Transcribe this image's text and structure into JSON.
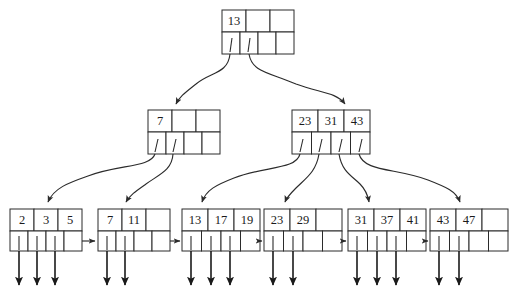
{
  "diagram": {
    "ink_color": "#2b2b2b",
    "fill_color": "#ffffff",
    "levels": 3,
    "fanout": 4
  },
  "root": {
    "name": "root-node",
    "keys": [
      "13",
      "",
      ""
    ],
    "pointers": [
      "p0",
      "p1",
      "p2",
      "p3"
    ],
    "occupied_pointers": 2
  },
  "internal": [
    {
      "name": "internal-node-left",
      "keys": [
        "7",
        "",
        ""
      ],
      "pointers": [
        "p0",
        "p1",
        "p2",
        "p3"
      ],
      "occupied_pointers": 2
    },
    {
      "name": "internal-node-right",
      "keys": [
        "23",
        "31",
        "43"
      ],
      "pointers": [
        "p0",
        "p1",
        "p2",
        "p3"
      ],
      "occupied_pointers": 4
    }
  ],
  "leaves": [
    {
      "name": "leaf-node-1",
      "keys": [
        "2",
        "3",
        "5"
      ],
      "record_pointers": 3
    },
    {
      "name": "leaf-node-2",
      "keys": [
        "7",
        "11",
        ""
      ],
      "record_pointers": 2
    },
    {
      "name": "leaf-node-3",
      "keys": [
        "13",
        "17",
        "19"
      ],
      "record_pointers": 3
    },
    {
      "name": "leaf-node-4",
      "keys": [
        "23",
        "29",
        ""
      ],
      "record_pointers": 2
    },
    {
      "name": "leaf-node-5",
      "keys": [
        "31",
        "37",
        "41"
      ],
      "record_pointers": 3
    },
    {
      "name": "leaf-node-6",
      "keys": [
        "43",
        "47",
        ""
      ],
      "record_pointers": 2
    }
  ],
  "sibling_links": 5,
  "geometry": {
    "root": {
      "x": 222,
      "y": 10,
      "cell_w": 24,
      "key_h": 22,
      "ptr_h": 22
    },
    "internal": [
      {
        "x": 148,
        "y": 110
      },
      {
        "x": 292,
        "y": 110
      }
    ],
    "leaves": [
      {
        "x": 10
      },
      {
        "x": 98
      },
      {
        "x": 182
      },
      {
        "x": 264
      },
      {
        "x": 348
      },
      {
        "x": 430
      }
    ],
    "leaf_y": 209,
    "leaf_cell_w": 24,
    "leaf_key_h": 22,
    "leaf_ptr_h": 20
  }
}
